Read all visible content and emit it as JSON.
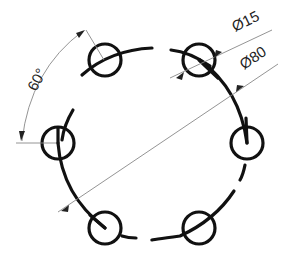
{
  "drawing": {
    "title": "Bolt hole circle pattern",
    "pattern_center": [
      152,
      143
    ],
    "pitch_radius_px": 95,
    "hole_radius_px": 16,
    "hole_count": 6,
    "angular_spacing_deg": 60
  },
  "dimensions": {
    "hole_diameter": "Ø15",
    "pitch_diameter": "Ø80",
    "angle": "60°"
  },
  "colors": {
    "geometry": "#111111",
    "dimension_lines": "#888888",
    "text": "#222222"
  }
}
